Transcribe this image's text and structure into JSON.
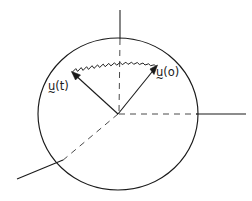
{
  "figure": {
    "background_color": "#ffffff",
    "stroke_color": "#1a1a1a",
    "labels": {
      "u_t": {
        "var": "u",
        "accent": "~",
        "arg": "(t)",
        "full": "u(t)"
      },
      "u_zero": {
        "var": "u",
        "accent": "~",
        "arg": "(o)",
        "full": "u(o)"
      }
    },
    "geometry": {
      "circle": {
        "cx": 118,
        "cy": 114,
        "rx": 80,
        "ry": 76
      },
      "origin": {
        "x": 118,
        "y": 114
      },
      "vector_u_t_tip": {
        "x": 72,
        "y": 72
      },
      "vector_u_zero_tip": {
        "x": 157,
        "y": 66
      },
      "vertical_axis_top": {
        "x": 120,
        "y": 10
      },
      "horizontal_axis_right": {
        "x": 246,
        "y": 114
      },
      "diagonal_lower_left": {
        "x": 17,
        "y": 179
      }
    }
  }
}
